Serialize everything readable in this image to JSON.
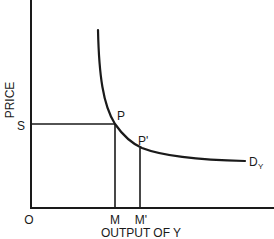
{
  "diagram": {
    "type": "demand-curve",
    "axes": {
      "y_label": "PRICE",
      "x_label": "OUTPUT OF Y",
      "origin_label": "O"
    },
    "price_level_label": "S",
    "points": [
      {
        "label": "P",
        "x_label": "M"
      },
      {
        "label": "P'",
        "x_label": "M'"
      }
    ],
    "curve": {
      "label_main": "D",
      "label_sub": "Y",
      "description": "Demand curve for Y, steep at low output and flattening at high output"
    }
  }
}
